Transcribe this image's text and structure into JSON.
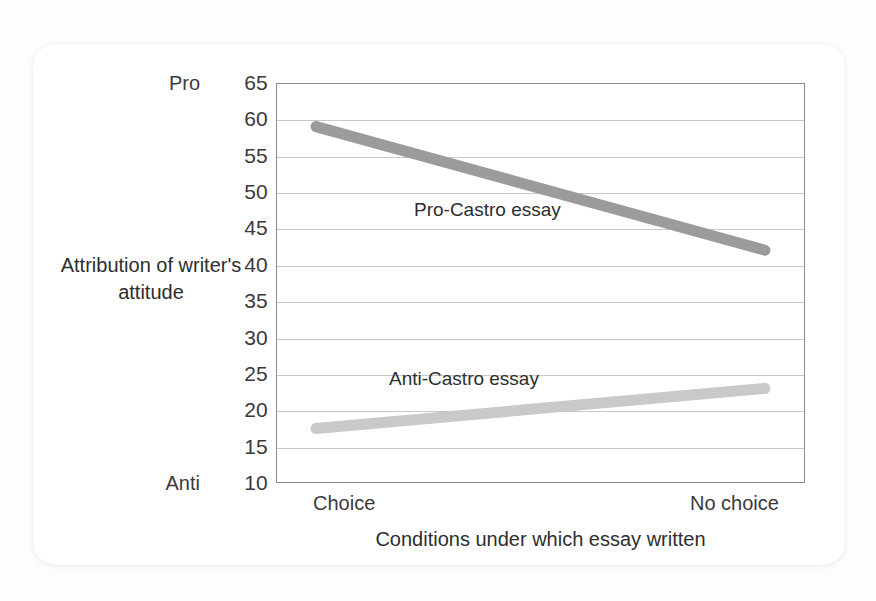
{
  "chart_data": {
    "type": "line",
    "title": "",
    "xlabel": "Conditions under which essay written",
    "ylabel": "Attribution of writer's attitude",
    "categories": [
      "Choice",
      "No choice"
    ],
    "x": [
      0,
      1
    ],
    "ylim": [
      10,
      65
    ],
    "yticks": [
      65,
      60,
      55,
      50,
      45,
      40,
      35,
      30,
      25,
      20,
      15,
      10
    ],
    "ytick_labels": [
      "65",
      "60",
      "55",
      "50",
      "45",
      "40",
      "35",
      "30",
      "25",
      "20",
      "15",
      "10"
    ],
    "y_anchor_high": "Pro",
    "y_anchor_low": "Anti",
    "y_anchor_high_value": 65,
    "y_anchor_low_value": 10,
    "grid": true,
    "legend_position": "inline-annotation",
    "series": [
      {
        "name": "Pro-Castro essay",
        "values": [
          59,
          42
        ],
        "color": "#9b9b9b",
        "label_position": "above-line-left"
      },
      {
        "name": "Anti-Castro essay",
        "values": [
          17.5,
          23
        ],
        "color": "#c9c9c9",
        "label_position": "above-line-left"
      }
    ],
    "annotations": [
      {
        "text": "Pro-Castro essay",
        "series": "Pro-Castro essay"
      },
      {
        "text": "Anti-Castro essay",
        "series": "Anti-Castro essay"
      }
    ]
  },
  "figure": {
    "axis_frame_color": "#8c8c8c",
    "gridline_color": "#c9c9c9",
    "card_background": "#ffffff",
    "page_background": "#fdfdfd",
    "text_color": "#2e2e2e"
  }
}
